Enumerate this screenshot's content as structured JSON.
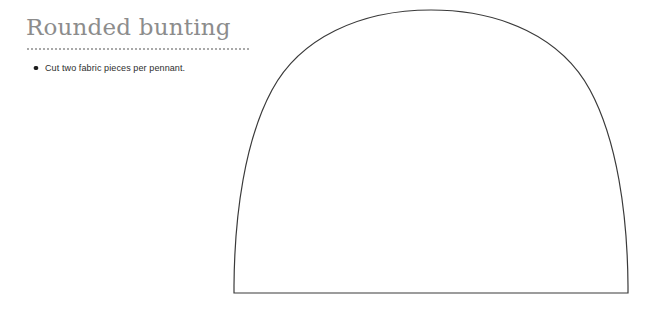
{
  "page": {
    "background_color": "#ffffff",
    "width": 665,
    "height": 311
  },
  "header": {
    "title": "Rounded bunting",
    "title_color": "#8c8c8c",
    "divider_color": "#a9a9a9",
    "divider_style": "dotted"
  },
  "notes": {
    "items": [
      {
        "bullet": "filled-circle",
        "text": "Cut two fabric pieces per pennant."
      }
    ],
    "text_color": "#2e2e2e",
    "bullet_color": "#1d1d1d"
  },
  "pattern": {
    "name": "rounded-bunting-pennant-template",
    "description": "Rounded arch pennant outline, flat base with domed top",
    "stroke_color": "#3a3a3a",
    "fill_color": "#ffffff",
    "stroke_width": 1.2,
    "geometry": {
      "base_left_x": 234,
      "base_right_x": 628,
      "base_y": 293,
      "apex_x": 431,
      "apex_y": 10,
      "width": 394,
      "height": 283
    },
    "outline_path": "M 234 293 L 234 286 C 234.5 214 245 140 272 90 C 300 38 360 10 431 10 C 502 10 562 38 590 90 C 617 140 627.5 214 628 286 L 628 293 Z"
  }
}
